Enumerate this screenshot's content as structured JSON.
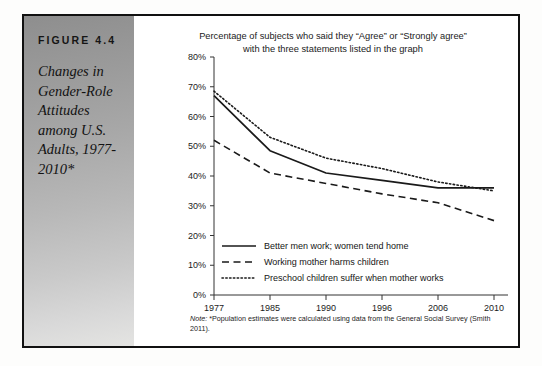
{
  "figure": {
    "label": "FIGURE 4.4",
    "caption": "Changes in Gender-Role Attitudes among U.S. Adults, 1977-2010*"
  },
  "note": {
    "prefix": "Note:",
    "text": " *Population estimates were calculated using data from the General Social Survey (Smith 2011)."
  },
  "chart_data": {
    "type": "line",
    "title": "Percentage of subjects who said they “Agree” or “Strongly agree” with the three statements listed in the graph",
    "title_line1": "Percentage of subjects who said they “Agree” or “Strongly agree”",
    "title_line2": "with the three statements listed in the graph",
    "xlabel": "",
    "ylabel": "",
    "categories": [
      "1977",
      "1985",
      "1990",
      "1996",
      "2006",
      "2010"
    ],
    "ylim": [
      0,
      80
    ],
    "ytick_values": [
      0,
      10,
      20,
      30,
      40,
      50,
      60,
      70,
      80
    ],
    "ytick_labels": [
      "0%",
      "10%",
      "20%",
      "30%",
      "40%",
      "50%",
      "60%",
      "70%",
      "80%"
    ],
    "grid": false,
    "legend_position": "inside-lower-left",
    "series": [
      {
        "name": "Better men work; women tend home",
        "style": "solid",
        "color": "#1a1a1a",
        "values": [
          67,
          48.5,
          41,
          38.5,
          36,
          36
        ]
      },
      {
        "name": "Working mother harms children",
        "style": "dashed",
        "color": "#1a1a1a",
        "values": [
          52,
          41,
          37.5,
          34,
          31,
          25
        ]
      },
      {
        "name": "Preschool children suffer when mother works",
        "style": "dotted",
        "color": "#1a1a1a",
        "values": [
          68.5,
          53,
          46,
          42.5,
          38,
          35
        ]
      }
    ]
  }
}
